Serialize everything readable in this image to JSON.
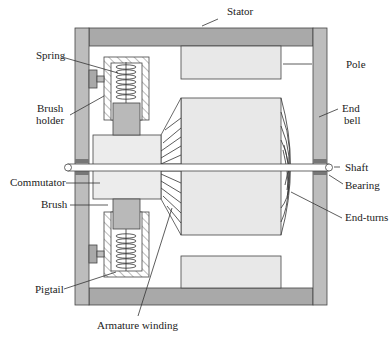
{
  "labels": {
    "stator": "Stator",
    "spring": "Spring",
    "brush_holder_1": "Brush",
    "brush_holder_2": "holder",
    "pole": "Pole",
    "end_bell_1": "End",
    "end_bell_2": "bell",
    "shaft": "Shaft",
    "bearing": "Bearing",
    "commutator": "Commutator",
    "brush": "Brush",
    "end_turns": "End-turns",
    "pigtail": "Pigtail",
    "armature_winding": "Armature winding"
  },
  "colors": {
    "stator": "#a9a9a9",
    "end_bell": "#bdbdbd",
    "pole": "#e8e8e8",
    "armature": "#e8e8e8",
    "commutator": "#ececec",
    "brush": "#b9b9b9",
    "bearing": "#777777"
  }
}
